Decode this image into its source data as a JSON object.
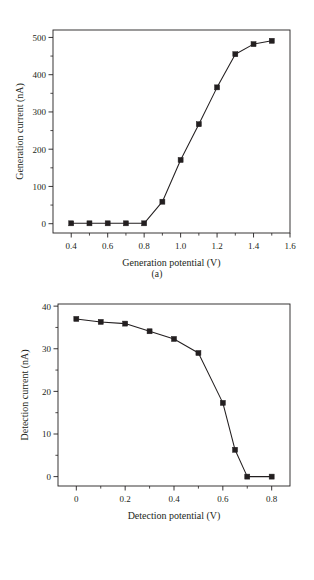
{
  "figure": {
    "panels": [
      {
        "caption": "(a)",
        "chart_ref": 0
      },
      {
        "caption": "(b)",
        "chart_ref": 1
      }
    ]
  },
  "chart_data": [
    {
      "type": "line",
      "title": "",
      "xlabel": "Generation potential (V)",
      "ylabel": "Generation current (nA)",
      "xlim": [
        0.3,
        1.6
      ],
      "ylim": [
        -25,
        520
      ],
      "xticks": [
        0.4,
        0.6,
        0.8,
        1.0,
        1.2,
        1.4,
        1.6
      ],
      "xticklabels": [
        "0.4",
        "0.6",
        "0.8",
        "1.0",
        "1.2",
        "1.4",
        "1.6"
      ],
      "xminorticks": [
        0.5,
        0.7,
        0.9,
        1.1,
        1.3,
        1.5
      ],
      "yticks": [
        0,
        100,
        200,
        300,
        400,
        500
      ],
      "yticklabels": [
        "0",
        "100",
        "200",
        "300",
        "400",
        "500"
      ],
      "yminorticks": [
        50,
        150,
        250,
        350,
        450
      ],
      "grid": false,
      "legend": "none",
      "marker": "square",
      "line_color": "#231f20",
      "x": [
        0.4,
        0.5,
        0.6,
        0.7,
        0.8,
        0.9,
        1.0,
        1.1,
        1.2,
        1.3,
        1.4,
        1.5
      ],
      "values": [
        1,
        1,
        1,
        1,
        1,
        59,
        171,
        267,
        366,
        455,
        482,
        491
      ]
    },
    {
      "type": "line",
      "title": "",
      "xlabel": "Detection potential (V)",
      "ylabel": "Detection current (nA)",
      "xlim": [
        -0.075,
        0.875
      ],
      "ylim": [
        -2.2,
        40.5
      ],
      "xticks": [
        0.0,
        0.2,
        0.4,
        0.6,
        0.8
      ],
      "xticklabels": [
        "0",
        "0.2",
        "0.4",
        "0.6",
        "0.8"
      ],
      "xminorticks": [
        0.1,
        0.3,
        0.5,
        0.7
      ],
      "yticks": [
        0,
        10,
        20,
        30,
        40
      ],
      "yticklabels": [
        "0",
        "10",
        "20",
        "30",
        "40"
      ],
      "yminorticks": [
        5,
        15,
        25,
        35
      ],
      "grid": false,
      "legend": "none",
      "marker": "square",
      "line_color": "#231f20",
      "x": [
        0.0,
        0.1,
        0.2,
        0.3,
        0.4,
        0.5,
        0.6,
        0.65,
        0.7,
        0.8
      ],
      "values": [
        37.0,
        36.3,
        35.9,
        34.1,
        32.3,
        29.0,
        17.3,
        6.3,
        0.0,
        0.0
      ]
    }
  ]
}
